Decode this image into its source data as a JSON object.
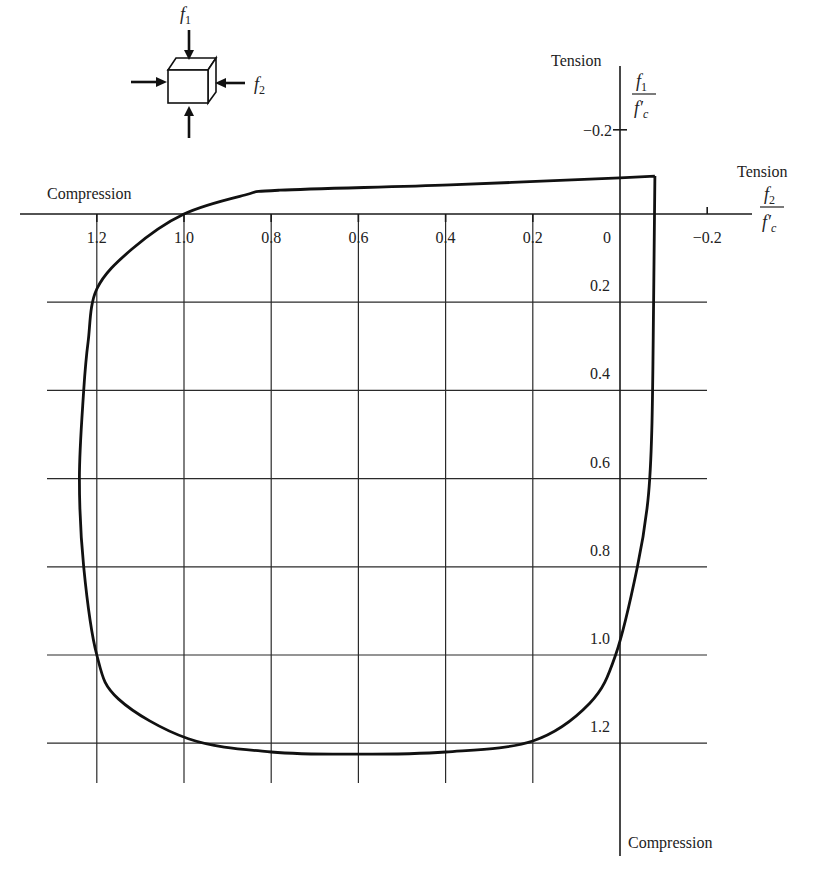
{
  "chart_data": {
    "type": "line",
    "xlabel": "f2 / f'c",
    "ylabel": "f1 / f'c",
    "x_axis": {
      "label_num": "f2",
      "label_den": "f'c",
      "direction_note": "values increase to the left (compression positive)",
      "ticks": [
        1.2,
        1.0,
        0.8,
        0.6,
        0.4,
        0.2,
        0,
        -0.2
      ],
      "tick_labels": [
        "1.2",
        "1.0",
        "0.8",
        "0.6",
        "0.4",
        "0.2",
        "0",
        "−0.2"
      ],
      "positive_side_label": "Compression",
      "negative_side_label": "Tension",
      "range": [
        1.35,
        -0.3
      ]
    },
    "y_axis": {
      "label_num": "f1",
      "label_den": "f'c",
      "direction_note": "values increase downward (compression positive)",
      "ticks": [
        -0.2,
        0.2,
        0.4,
        0.6,
        0.8,
        1.0,
        1.2
      ],
      "tick_labels": [
        "−0.2",
        "0.2",
        "0.4",
        "0.6",
        "0.8",
        "1.0",
        "1.2"
      ],
      "positive_side_label": "Compression",
      "negative_side_label": "Tension",
      "range": [
        -0.3,
        1.45
      ]
    },
    "grid": true,
    "legend": null,
    "inset": {
      "description": "cube under biaxial compressive stresses",
      "label_vertical": "f1",
      "label_horizontal": "f2"
    },
    "series": [
      {
        "name": "Failure envelope",
        "points": [
          {
            "f2": -0.08,
            "f1": -0.086
          },
          {
            "f2": 0.0,
            "f1": -0.082
          },
          {
            "f2": 0.39,
            "f1": -0.066
          },
          {
            "f2": 0.78,
            "f1": -0.054
          },
          {
            "f2": 0.86,
            "f1": -0.043
          },
          {
            "f2": 1.0,
            "f1": 0.0
          },
          {
            "f2": 1.12,
            "f1": 0.08
          },
          {
            "f2": 1.2,
            "f1": 0.17
          },
          {
            "f2": 1.22,
            "f1": 0.29
          },
          {
            "f2": 1.23,
            "f1": 0.4
          },
          {
            "f2": 1.24,
            "f1": 0.6
          },
          {
            "f2": 1.23,
            "f1": 0.8
          },
          {
            "f2": 1.2,
            "f1": 1.0
          },
          {
            "f2": 1.15,
            "f1": 1.1
          },
          {
            "f2": 0.99,
            "f1": 1.19
          },
          {
            "f2": 0.8,
            "f1": 1.22
          },
          {
            "f2": 0.6,
            "f1": 1.225
          },
          {
            "f2": 0.4,
            "f1": 1.22
          },
          {
            "f2": 0.2,
            "f1": 1.195
          },
          {
            "f2": 0.07,
            "f1": 1.11
          },
          {
            "f2": 0.01,
            "f1": 1.0
          },
          {
            "f2": -0.04,
            "f1": 0.8
          },
          {
            "f2": -0.064,
            "f1": 0.65
          },
          {
            "f2": -0.073,
            "f1": 0.49
          },
          {
            "f2": -0.077,
            "f1": 0.2
          },
          {
            "f2": -0.08,
            "f1": -0.086
          }
        ]
      }
    ]
  },
  "labels": {
    "tension_top": "Tension",
    "tension_right": "Tension",
    "compression_left": "Compression",
    "compression_bottom": "Compression",
    "f1": "f",
    "f1_sub": "1",
    "f2": "f",
    "f2_sub": "2",
    "fc": "f′",
    "fc_sub": "c"
  }
}
